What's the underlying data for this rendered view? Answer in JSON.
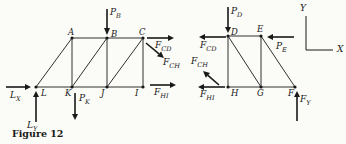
{
  "caption": "Figure 12",
  "axes": {
    "x": "X",
    "y": "Y"
  },
  "nodes": {
    "A": "A",
    "B": "B",
    "C": "C",
    "L": "L",
    "K": "K",
    "J": "J",
    "I": "I",
    "D": "D",
    "E": "E",
    "H": "H",
    "G": "G",
    "F": "F"
  },
  "forces": {
    "PB": {
      "main": "P",
      "sub": "B"
    },
    "PK": {
      "main": "P",
      "sub": "K"
    },
    "PD": {
      "main": "P",
      "sub": "D"
    },
    "PE": {
      "main": "P",
      "sub": "E"
    },
    "FCD": {
      "main": "F",
      "sub": "CD"
    },
    "FCH": {
      "main": "F",
      "sub": "CH"
    },
    "FHI": {
      "main": "F",
      "sub": "HI"
    },
    "FY": {
      "main": "F",
      "sub": "Y"
    },
    "LX": {
      "main": "L",
      "sub": "X"
    },
    "LY": {
      "main": "L",
      "sub": "Y"
    }
  },
  "colors": {
    "ink": "#191919",
    "paper": "#fbfbf7"
  }
}
